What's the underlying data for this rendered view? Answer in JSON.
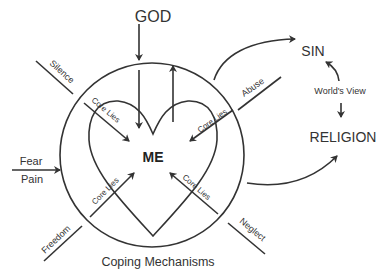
{
  "diagram": {
    "top_label": "GOD",
    "center_label": "ME",
    "bottom_label": "Coping Mechanisms",
    "right_top_label": "SIN",
    "right_middle_label": "World's View",
    "right_bottom_label": "RELIGION",
    "left_labels": {
      "upper": "Fear",
      "lower": "Pain"
    },
    "outer_barriers": {
      "top_left": "Silence",
      "top_right": "Abuse",
      "bottom_left": "Freedom",
      "bottom_right": "Neglect"
    },
    "inner_arrows": {
      "top_left": "Core  Lies",
      "top_right": "Core  Lies",
      "bottom_left": "Core  Lies",
      "bottom_right": "Core  Lies"
    },
    "colors": {
      "stroke": "#333333",
      "background": "#ffffff",
      "text": "#333333"
    }
  }
}
